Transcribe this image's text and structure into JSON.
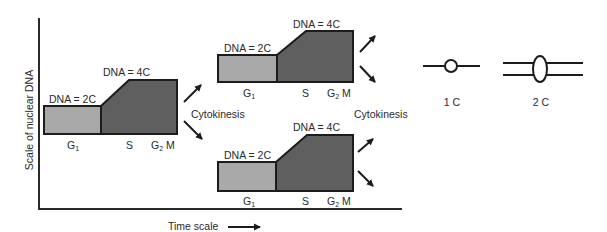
{
  "axes": {
    "y_label": "Scale of nuclear DNA",
    "x_label": "Time scale"
  },
  "colors": {
    "g1_fill": "#a9a9a9",
    "sg2m_fill": "#5f5f5f",
    "stroke": "#1c1c1c"
  },
  "cycles": [
    {
      "id": "parent",
      "dna_low_label": "DNA = 2C",
      "dna_high_label": "DNA = 4C",
      "phases": {
        "g1": "G",
        "g1_sub": "1",
        "s": "S",
        "g2": "G",
        "g2_sub": "2",
        "m": "M"
      }
    },
    {
      "id": "daughter-top",
      "dna_low_label": "DNA = 2C",
      "dna_high_label": "DNA = 4C",
      "phases": {
        "g1": "G",
        "g1_sub": "1",
        "s": "S",
        "g2": "G",
        "g2_sub": "2",
        "m": "M"
      }
    },
    {
      "id": "daughter-bottom",
      "dna_low_label": "DNA = 2C",
      "dna_high_label": "DNA = 4C",
      "phases": {
        "g1": "G",
        "g1_sub": "1",
        "s": "S",
        "g2": "G",
        "g2_sub": "2",
        "m": "M"
      }
    }
  ],
  "transitions": [
    {
      "label": "Cytokinesis"
    },
    {
      "label": "Cytokinesis"
    }
  ],
  "legend": {
    "one_c_label": "1 C",
    "two_c_label": "2 C"
  }
}
